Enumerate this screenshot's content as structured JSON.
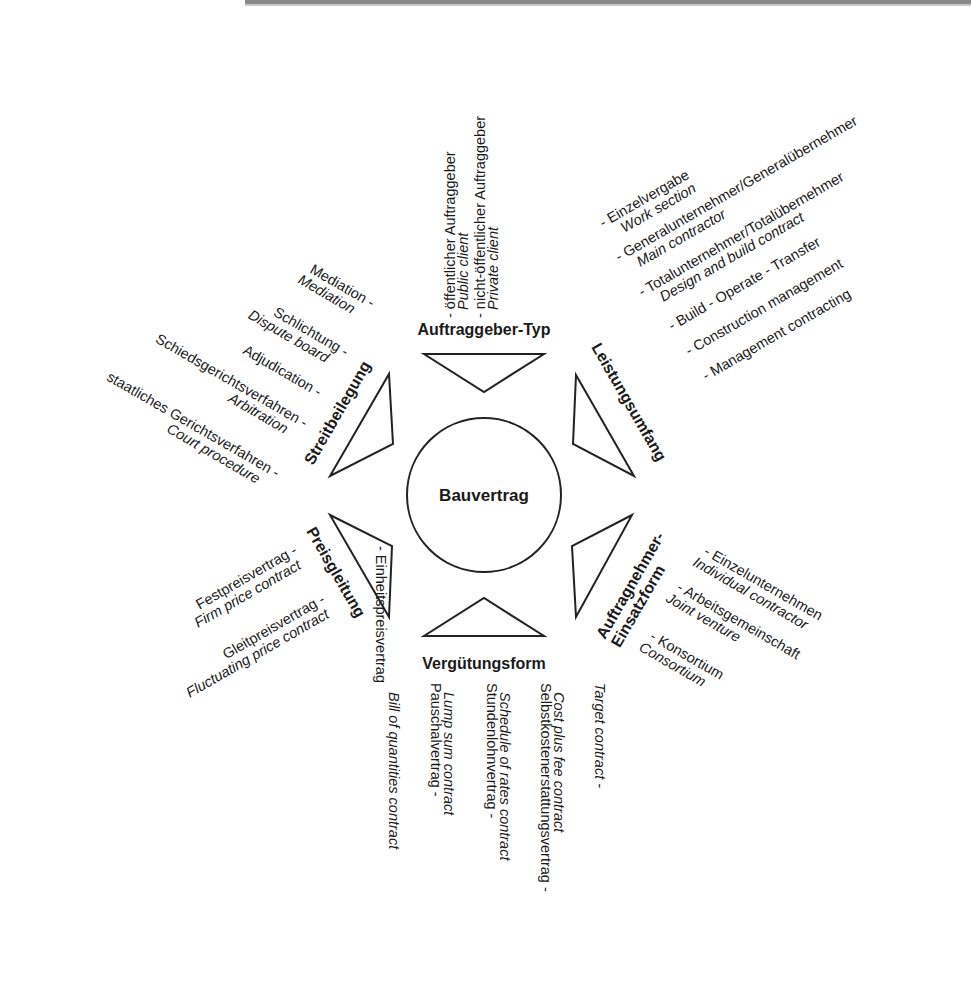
{
  "diagram": {
    "hub": {
      "label": "Bauvertrag"
    },
    "categories": {
      "top": {
        "label": "Auftraggeber-Typ",
        "items": [
          {
            "de": "- öffentlicher Auftraggeber",
            "en": "Public client"
          },
          {
            "de": "- nicht-öffentlicher Auftraggeber",
            "en": "Private client"
          }
        ]
      },
      "upper_right": {
        "label": "Leistungsumfang",
        "items": [
          {
            "de": "- Einzelvergabe",
            "en": "Work section"
          },
          {
            "de": "- Generalunternehmer/Generalübernehmer",
            "en": "Main contractor"
          },
          {
            "de": "- Totalunternehmer/Totalübernehmer",
            "en": "Design and build contract"
          },
          {
            "de": "- Build - Operate - Transfer",
            "en": ""
          },
          {
            "de": "- Construction management",
            "en": ""
          },
          {
            "de": "- Management contracting",
            "en": ""
          }
        ]
      },
      "lower_right": {
        "label_line1": "Auftragnehmer-",
        "label_line2": "Einsatzform",
        "items": [
          {
            "de": "- Einzelunternehmen",
            "en": "Individual contractor"
          },
          {
            "de": "- Arbeitsgemeinschaft",
            "en": "Joint venture"
          },
          {
            "de": "- Konsortium",
            "en": "Consortium"
          }
        ]
      },
      "bottom": {
        "label": "Vergütungsform",
        "items": [
          {
            "de": "Einheitspreisvertrag -",
            "en": "Bill of quantities contract"
          },
          {
            "de": "Pauschalvertrag -",
            "en": "Lump sum contract"
          },
          {
            "de": "Stundenlohnvertrag -",
            "en": "Schedule of rates contract"
          },
          {
            "de": "Selbstkostenerstattungsvertrag -",
            "en": "Cost plus fee contract"
          },
          {
            "de": "",
            "en": "Target contract -"
          }
        ]
      },
      "lower_left": {
        "label": "Preisgleitung",
        "items": [
          {
            "de": "Festpreisvertrag -",
            "en": "Firm price contract"
          },
          {
            "de": "Gleitpreisvertrag -",
            "en": "Fluctuating price contract"
          }
        ]
      },
      "upper_left": {
        "label": "Streitbeilegung",
        "items": [
          {
            "de": "Mediation -",
            "en": "Mediation"
          },
          {
            "de": "Schlichtung -",
            "en": "Dispute board"
          },
          {
            "de": "Adjudication -",
            "en": ""
          },
          {
            "de": "Schiedsgerichtsverfahren -",
            "en": "Arbitration"
          },
          {
            "de": "staatliches Gerichtsverfahren -",
            "en": "Court procedure"
          }
        ]
      }
    }
  }
}
